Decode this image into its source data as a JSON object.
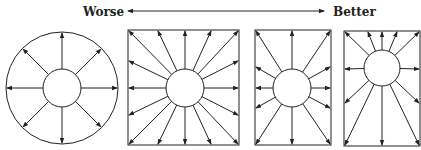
{
  "scale": {
    "worse_label": "Worse",
    "better_label": "Better"
  },
  "figures": [
    {
      "name": "circle-figure",
      "shape": "circle",
      "arrows": 8
    },
    {
      "name": "square-figure",
      "shape": "square",
      "arrows": 16
    },
    {
      "name": "rectangle-figure",
      "shape": "rectangle",
      "arrows": 12
    },
    {
      "name": "rectangle-offset-figure",
      "shape": "rectangle-offset-center",
      "arrows": 12
    }
  ],
  "colors": {
    "stroke": "#222222",
    "background": "#ffffff"
  }
}
